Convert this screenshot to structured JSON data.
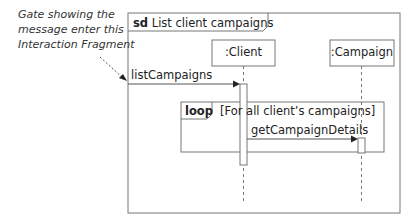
{
  "diagram": {
    "type": "UML sequence diagram",
    "frame": {
      "operator": "sd",
      "name": "List client campaigns"
    },
    "annotation": {
      "lines": [
        "Gate showing the",
        "message enter this",
        "Interaction Fragment"
      ]
    },
    "lifelines": [
      {
        "name": ":Client"
      },
      {
        "name": ":Campaign"
      }
    ],
    "messages": [
      {
        "label": "listCampaigns",
        "from": "gate",
        "to": ":Client"
      },
      {
        "label": "getCampaignDetails",
        "from": ":Client",
        "to": ":Campaign"
      }
    ],
    "fragment": {
      "operator": "loop",
      "guard": "[For all client’s campaigns]"
    }
  }
}
